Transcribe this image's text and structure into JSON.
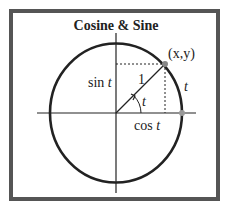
{
  "title": "Cosine & Sine",
  "labels": {
    "point": "(x,y)",
    "radius": "1",
    "sin": "sin t",
    "cos": "cos t",
    "angle": "t",
    "arc": "t"
  },
  "colors": {
    "frame": "#555555",
    "line": "#222222",
    "point": "#888888"
  }
}
